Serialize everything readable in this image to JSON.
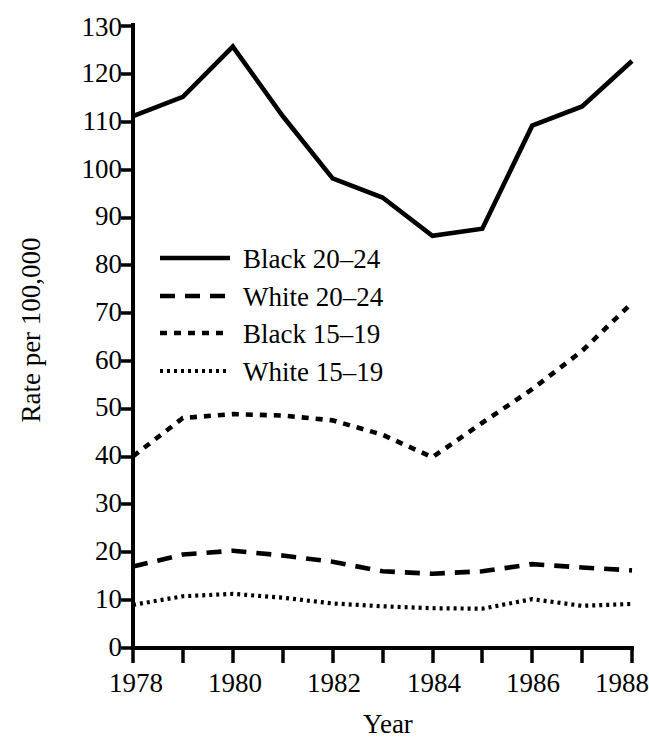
{
  "chart_data": {
    "type": "line",
    "title": "",
    "xlabel": "Year",
    "ylabel": "Rate per 100,000",
    "x": [
      1978,
      1979,
      1980,
      1981,
      1982,
      1983,
      1984,
      1985,
      1986,
      1987,
      1988
    ],
    "xlim": [
      1978,
      1988
    ],
    "ylim": [
      0,
      130
    ],
    "xticks": [
      1978,
      1979,
      1980,
      1981,
      1982,
      1983,
      1984,
      1985,
      1986,
      1987,
      1988
    ],
    "xtick_labels": [
      "1978",
      "",
      "1980",
      "",
      "1982",
      "",
      "1984",
      "",
      "1986",
      "",
      "1988"
    ],
    "yticks": [
      0,
      10,
      20,
      30,
      40,
      50,
      60,
      70,
      80,
      90,
      100,
      110,
      120,
      130
    ],
    "ytick_labels": [
      "0",
      "10",
      "20",
      "30",
      "40",
      "50",
      "60",
      "70",
      "80",
      "90",
      "100",
      "110",
      "120",
      "130"
    ],
    "grid": false,
    "legend_position": "center-left",
    "series": [
      {
        "name": "Black 20–24",
        "style": "solid",
        "values": [
          111,
          115,
          125.5,
          111,
          98,
          94,
          86,
          87.5,
          109,
          113,
          122.5
        ]
      },
      {
        "name": "White 20–24",
        "style": "dashed",
        "values": [
          17,
          19.5,
          20.3,
          19.3,
          18,
          16,
          15.5,
          16,
          17.5,
          16.8,
          16.2
        ]
      },
      {
        "name": "Black 15–19",
        "style": "dash-dot",
        "values": [
          40,
          48,
          48.8,
          48.5,
          47.5,
          44.5,
          39.8,
          47,
          54,
          62,
          72
        ]
      },
      {
        "name": "White 15–19",
        "style": "dotted",
        "values": [
          9,
          10.8,
          11.3,
          10.5,
          9.3,
          8.7,
          8.3,
          8.2,
          10.2,
          8.8,
          9.2
        ]
      }
    ]
  },
  "legend": {
    "items": [
      {
        "label": "Black 20–24",
        "style": "solid"
      },
      {
        "label": "White 20–24",
        "style": "dashed"
      },
      {
        "label": "Black 15–19",
        "style": "dash-dot"
      },
      {
        "label": "White 15–19",
        "style": "dotted"
      }
    ]
  },
  "axes": {
    "y_title": "Rate per 100,000",
    "x_title": "Year",
    "y_labels": [
      "130",
      "120",
      "110",
      "100",
      "90",
      "80",
      "70",
      "60",
      "50",
      "40",
      "30",
      "20",
      "10",
      "0"
    ],
    "x_labels": [
      "1978",
      "1980",
      "1982",
      "1984",
      "1986",
      "1988"
    ]
  },
  "colors": {
    "ink": "#000000",
    "background": "#ffffff"
  }
}
